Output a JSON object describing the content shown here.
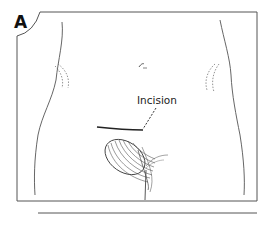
{
  "figure": {
    "panel_label": "A",
    "annotations": [
      {
        "label": "Incision",
        "target": "incision-line"
      }
    ],
    "elements": {
      "frame": "rectangular-border-with-rounded-notch-top-left",
      "torso_outline": "lower-abdomen-and-pelvis",
      "navel": true,
      "hip_bone_marks": "dotted-curves-left-and-right",
      "incision_line": "horizontal-suprapubic",
      "leader_line": "dashed",
      "genital_region": "hatched-shading",
      "bottom_rule": true
    },
    "colors": {
      "ink": "#333333",
      "background": "#ffffff"
    }
  }
}
